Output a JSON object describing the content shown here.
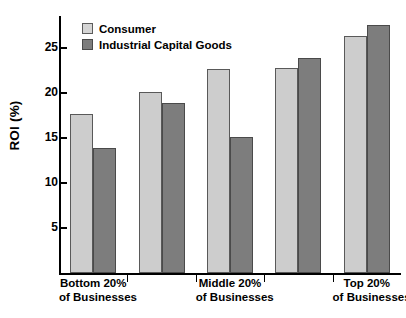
{
  "chart_data": {
    "type": "bar",
    "title": "",
    "subtitle": "",
    "xlabel": "",
    "ylabel": "ROI (%)",
    "ylim": [
      0,
      28.5
    ],
    "yticks": [
      5,
      10,
      15,
      20,
      25
    ],
    "ytick_labels": [
      "5",
      "10",
      "15",
      "20",
      "25"
    ],
    "grid": false,
    "legend_position": "top-left",
    "categories": [
      "Bottom 20% of Businesses",
      "",
      "Middle 20% of Businesses",
      "",
      "Top 20% of Businesses"
    ],
    "category_lines": [
      {
        "line1": "Bottom 20%",
        "line2": "of Businesses"
      },
      {
        "line1": "",
        "line2": ""
      },
      {
        "line1": "Middle 20%",
        "line2": "of Businesses"
      },
      {
        "line1": "",
        "line2": ""
      },
      {
        "line1": "Top 20%",
        "line2": "of Businesses"
      }
    ],
    "series": [
      {
        "name": "Consumer",
        "color": "#cdcdcd",
        "values": [
          17.6,
          20.1,
          22.6,
          22.7,
          26.3
        ]
      },
      {
        "name": "Industrial Capital Goods",
        "color": "#7d7d7d",
        "values": [
          13.9,
          18.9,
          15.1,
          23.8,
          27.5
        ]
      }
    ]
  },
  "legend": {
    "items": [
      {
        "label": "Consumer",
        "swatch": "consumer"
      },
      {
        "label": "Industrial Capital Goods",
        "swatch": "industrial"
      }
    ]
  },
  "axis": {
    "y_label": "ROI (%)"
  }
}
